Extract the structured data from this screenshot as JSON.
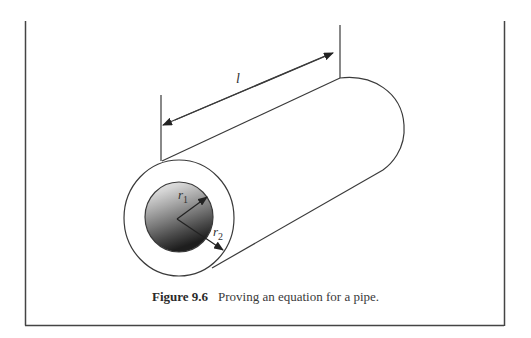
{
  "figure": {
    "number_label": "Figure 9.6",
    "caption_text": "Proving an equation for a pipe."
  },
  "diagram": {
    "length_label": "l",
    "inner_radius_label": {
      "symbol": "r",
      "subscript": "1"
    },
    "outer_radius_label": {
      "symbol": "r",
      "subscript": "2"
    }
  },
  "colors": {
    "line": "#3a3a3a",
    "frame": "#444444",
    "background": "#ffffff",
    "gradient_light": "#e6e6e6",
    "gradient_dark": "#2a2a2a"
  }
}
